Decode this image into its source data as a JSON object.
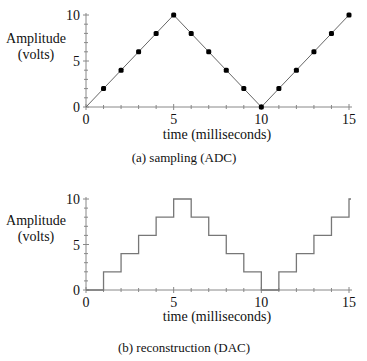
{
  "chart_data": [
    {
      "type": "line",
      "title": "(a)  sampling  (ADC)",
      "xlabel": "time  (milliseconds)",
      "ylabel": "Amplitude (volts)",
      "ylabel_line1": "Amplitude",
      "ylabel_line2": "(volts)",
      "x": [
        0,
        1,
        2,
        3,
        4,
        5,
        6,
        7,
        8,
        9,
        10,
        11,
        12,
        13,
        14,
        15
      ],
      "values": [
        0,
        2,
        4,
        6,
        8,
        10,
        8,
        6,
        4,
        2,
        0,
        2,
        4,
        6,
        8,
        10
      ],
      "markers": true,
      "xlim": [
        0,
        15
      ],
      "ylim": [
        0,
        10
      ],
      "x_ticks": [
        "0",
        "5",
        "10",
        "15"
      ],
      "y_ticks": [
        "0",
        "5",
        "10"
      ],
      "grid": false
    },
    {
      "type": "line",
      "style": "step",
      "title": "(b)  reconstruction  (DAC)",
      "xlabel": "time  (milliseconds)",
      "ylabel": "Amplitude (volts)",
      "ylabel_line1": "Amplitude",
      "ylabel_line2": "(volts)",
      "x": [
        0,
        1,
        2,
        3,
        4,
        5,
        6,
        7,
        8,
        9,
        10,
        11,
        12,
        13,
        14,
        15
      ],
      "values": [
        0,
        2,
        4,
        6,
        8,
        10,
        8,
        6,
        4,
        2,
        0,
        2,
        4,
        6,
        8,
        10
      ],
      "xlim": [
        0,
        15
      ],
      "ylim": [
        0,
        10
      ],
      "x_ticks": [
        "0",
        "5",
        "10",
        "15"
      ],
      "y_ticks": [
        "0",
        "5",
        "10"
      ],
      "grid": false
    }
  ]
}
